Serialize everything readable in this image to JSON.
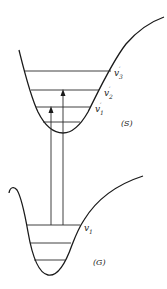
{
  "diagram": {
    "type": "potential-energy-diagram",
    "colors": {
      "line": "#1a1a1a",
      "background": "#ffffff"
    },
    "upper_state": {
      "label": "(S)",
      "levels": [
        {
          "label_base": "v",
          "label_sub": "3",
          "label_prime": "′"
        },
        {
          "label_base": "v",
          "label_sub": "2",
          "label_prime": "′"
        },
        {
          "label_base": "v",
          "label_sub": "1",
          "label_prime": "′"
        }
      ]
    },
    "lower_state": {
      "label": "(G)",
      "levels": [
        {
          "label_base": "v",
          "label_sub": "1"
        }
      ]
    },
    "transitions": [
      {
        "from": "v1",
        "to": "v1′"
      },
      {
        "from": "v1",
        "to": "v2′"
      }
    ]
  }
}
